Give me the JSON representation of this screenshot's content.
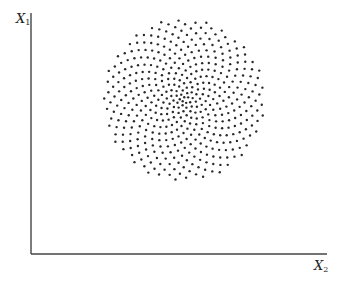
{
  "chart_data": {
    "type": "scatter",
    "title": "",
    "xlabel": "X2",
    "ylabel": "X1",
    "grid": false,
    "legend": null,
    "pattern": {
      "count": 460,
      "center_px": [
        184,
        100
      ],
      "radius_px": 81,
      "radial_exponent": 0.62,
      "golden_angle_deg": 137.508,
      "dot_radius_px": 1.2,
      "dot_color": "#2a2a2a"
    }
  },
  "axes": {
    "y_label_main": "X",
    "y_label_sub": "1",
    "x_label_main": "X",
    "x_label_sub": "2",
    "color": "#444444",
    "origin_px": [
      31,
      254
    ],
    "y_top_px": 13,
    "x_right_px": 327
  }
}
